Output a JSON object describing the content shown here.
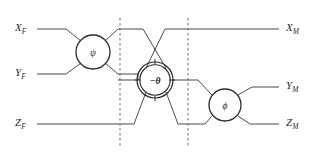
{
  "figure": {
    "title": "",
    "type": "quantum-circuit-butterfly-diagram",
    "width": 315,
    "height": 158,
    "background_color": "#ffffff",
    "wire_color": "#4a4a4a",
    "gate_stroke_color": "#2b2b2b",
    "separator_color": "#6b6b6b"
  },
  "inputs": [
    {
      "id": "x-in",
      "base": "X",
      "subscript": "F",
      "label": "X_F",
      "y": 29
    },
    {
      "id": "y-in",
      "base": "Y",
      "subscript": "F",
      "label": "Y_F",
      "y": 74
    },
    {
      "id": "z-in",
      "base": "Z",
      "subscript": "F",
      "label": "Z_F",
      "y": 124
    }
  ],
  "outputs": [
    {
      "id": "x-out",
      "base": "X",
      "subscript": "M",
      "label": "X_M",
      "y": 29
    },
    {
      "id": "y-out",
      "base": "Y",
      "subscript": "M",
      "label": "Y_M",
      "y": 87
    },
    {
      "id": "z-out",
      "base": "Z",
      "subscript": "M",
      "label": "Z_M",
      "y": 124
    }
  ],
  "gates": [
    {
      "id": "gate-psi",
      "symbol": "ψ",
      "name": "psi-gate",
      "cx": 93,
      "cy": 52,
      "r": 17,
      "style": "single-ring",
      "ticks": false
    },
    {
      "id": "gate-theta",
      "symbol": "−θ",
      "name": "minus-theta-gate",
      "cx": 155,
      "cy": 80,
      "r": 17,
      "style": "double-ring",
      "ticks": true
    },
    {
      "id": "gate-phi",
      "symbol": "ϕ",
      "name": "phi-gate",
      "cx": 225,
      "cy": 105,
      "r": 16,
      "style": "single-ring",
      "ticks": false
    }
  ],
  "separators": [
    {
      "id": "separator-1",
      "x": 120,
      "y1": 18,
      "y2": 146
    },
    {
      "id": "separator-2",
      "x": 188,
      "y1": 18,
      "y2": 146
    }
  ],
  "stage_labels": []
}
